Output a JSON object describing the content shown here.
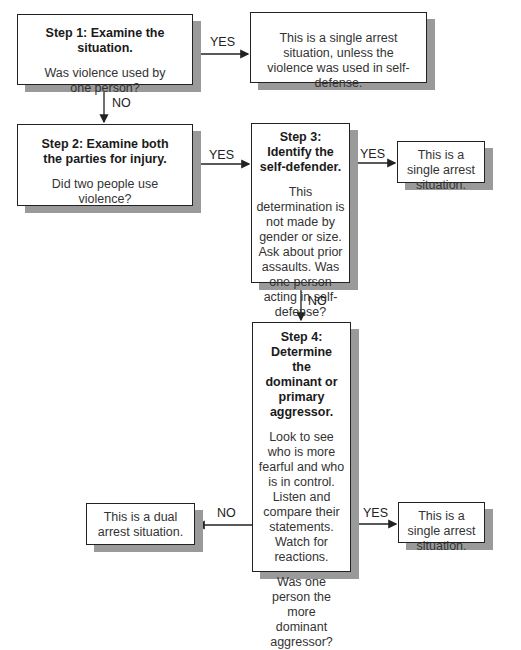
{
  "step1": {
    "title": "Step 1:  Examine the situation.",
    "question": "Was violence used by one person?"
  },
  "outcome1": {
    "text": "This is a single arrest situation, unless the violence was used in self-defense."
  },
  "step2": {
    "title": "Step 2:  Examine both the parties for injury.",
    "question": "Did two people use violence?"
  },
  "step3": {
    "title": "Step 3:  Identify the self-defender.",
    "question": "This determination is not made by gender or size. Ask about prior assaults. Was one person acting in self-defense?"
  },
  "outcome3": {
    "text": "This is a single arrest situation."
  },
  "step4": {
    "title": "Step 4: Determine the dominant or primary aggressor.",
    "guidance": "Look to see who is more fearful and who is in control. Listen and compare their statements. Watch for reactions.",
    "question": "Was one person the more dominant aggressor?"
  },
  "outcome4_yes": {
    "text": "This is a single arrest situation."
  },
  "outcome4_no": {
    "text": "This is a dual arrest situation."
  },
  "edges": {
    "s1_yes": "YES",
    "s1_no": "NO",
    "s2_yes": "YES",
    "s3_yes": "YES",
    "s3_no": "NO",
    "s4_yes": "YES",
    "s4_no": "NO"
  }
}
